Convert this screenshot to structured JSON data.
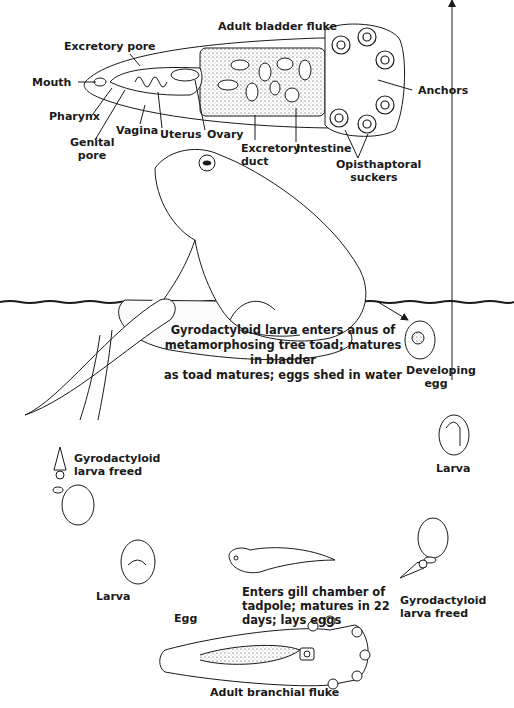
{
  "adult_bladder_fluke": {
    "title": "Adult bladder fluke",
    "labels": {
      "excretory_pore": "Excretory pore",
      "mouth": "Mouth",
      "pharynx": "Pharynx",
      "genital_pore_1": "Genital",
      "genital_pore_2": "pore",
      "vagina": "Vagina",
      "uterus": "Uterus",
      "ovary": "Ovary",
      "excretory_duct_1": "Excretory",
      "excretory_duct_2": "duct",
      "intestine": "Intestine",
      "anchors": "Anchors",
      "suckers_1": "Opisthaptoral",
      "suckers_2": "suckers"
    }
  },
  "toad_caption": {
    "line1": "Gyrodactyloid larva enters anus of",
    "line2": "metamorphosing tree toad; matures in bladder",
    "line3": "as toad matures; eggs shed in water"
  },
  "cycle": {
    "developing_egg_1": "Developing",
    "developing_egg_2": "egg",
    "larva_right": "Larva",
    "gyro_right_1": "Gyrodactyloid",
    "gyro_right_2": "larva freed",
    "tadpole_caption_1": "Enters gill chamber of",
    "tadpole_caption_2": "tadpole; matures in 22",
    "tadpole_caption_3": "days; lays eggs",
    "egg": "Egg",
    "larva_left": "Larva",
    "gyro_left_1": "Gyrodactyloid",
    "gyro_left_2": "larva freed",
    "adult_branchial": "Adult branchial fluke"
  }
}
